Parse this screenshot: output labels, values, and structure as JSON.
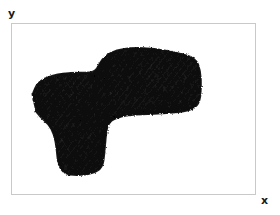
{
  "figure": {
    "type": "plot",
    "background_color": "#ffffff",
    "frame_color": "#c9c9c9",
    "trace_color": "#111111"
  },
  "axes": {
    "x_label": "x",
    "y_label": "y",
    "x_label_position": "bottom-right-outside",
    "y_label_position": "top-left-outside",
    "ticks_visible": false,
    "gridlines_visible": false,
    "frame_visible": true
  },
  "chart_data": {
    "type": "scatter",
    "title": "",
    "subtitle": "",
    "xlabel": "x",
    "ylabel": "y",
    "xlim": [
      0,
      1
    ],
    "ylim": [
      0,
      1
    ],
    "grid": false,
    "legend": null,
    "annotations": [],
    "tick_labels": {
      "x": [],
      "y": []
    },
    "series": [
      {
        "name": "trajectory",
        "color": "#111111",
        "style": "continuous-scribble",
        "density": "very-high",
        "outline_polygon_normalized": [
          [
            0.085,
            0.415
          ],
          [
            0.105,
            0.345
          ],
          [
            0.165,
            0.3
          ],
          [
            0.255,
            0.285
          ],
          [
            0.34,
            0.29
          ],
          [
            0.36,
            0.235
          ],
          [
            0.385,
            0.185
          ],
          [
            0.43,
            0.155
          ],
          [
            0.495,
            0.14
          ],
          [
            0.585,
            0.145
          ],
          [
            0.68,
            0.17
          ],
          [
            0.755,
            0.2
          ],
          [
            0.775,
            0.275
          ],
          [
            0.778,
            0.38
          ],
          [
            0.77,
            0.47
          ],
          [
            0.73,
            0.51
          ],
          [
            0.64,
            0.525
          ],
          [
            0.53,
            0.53
          ],
          [
            0.45,
            0.54
          ],
          [
            0.395,
            0.575
          ],
          [
            0.385,
            0.66
          ],
          [
            0.38,
            0.76
          ],
          [
            0.372,
            0.845
          ],
          [
            0.33,
            0.88
          ],
          [
            0.265,
            0.89
          ],
          [
            0.215,
            0.88
          ],
          [
            0.19,
            0.825
          ],
          [
            0.185,
            0.74
          ],
          [
            0.175,
            0.65
          ],
          [
            0.15,
            0.585
          ],
          [
            0.115,
            0.545
          ],
          [
            0.088,
            0.49
          ]
        ],
        "x": [],
        "y": []
      }
    ]
  }
}
